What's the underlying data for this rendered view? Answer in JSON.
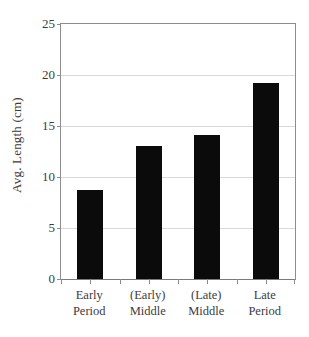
{
  "chart_data": {
    "type": "bar",
    "title": "",
    "xlabel": "",
    "ylabel": "Avg. Length (cm)",
    "categories": [
      "Early Period",
      "(Early) Middle",
      "(Late) Middle",
      "Late Period"
    ],
    "category_lines": [
      [
        "Early",
        "Period"
      ],
      [
        "(Early)",
        "Middle"
      ],
      [
        "(Late)",
        "Middle"
      ],
      [
        "Late",
        "Period"
      ]
    ],
    "values": [
      8.7,
      13.0,
      14.1,
      19.2
    ],
    "ylim": [
      0,
      25
    ],
    "yticks": [
      0,
      5,
      10,
      15,
      20,
      25
    ],
    "ytick_labels": [
      "0",
      "5",
      "10",
      "15",
      "20",
      "25"
    ],
    "grid": true,
    "grid_axis": "y",
    "legend": false,
    "bar_color": "#0b0b0b",
    "grid_color": "#d9d9d9",
    "axis_color": "#8d8d8d",
    "text_color": "#3d3d3d"
  }
}
